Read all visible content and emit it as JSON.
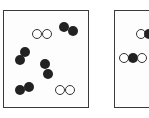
{
  "diagram": {
    "type": "particle-model",
    "panels": [
      {
        "id": "left",
        "box": {
          "x": 3,
          "y": 10,
          "w": 86,
          "h": 98
        },
        "molecules": [
          {
            "kind": "white-pair",
            "atoms": [
              {
                "x": 37,
                "y": 34,
                "r": 5,
                "fill": "light"
              },
              {
                "x": 47,
                "y": 34,
                "r": 5,
                "fill": "light"
              }
            ]
          },
          {
            "kind": "dark-pair",
            "atoms": [
              {
                "x": 64,
                "y": 27,
                "r": 5,
                "fill": "dark"
              },
              {
                "x": 73,
                "y": 31,
                "r": 5,
                "fill": "dark"
              }
            ]
          },
          {
            "kind": "dark-pair",
            "atoms": [
              {
                "x": 25,
                "y": 52,
                "r": 5,
                "fill": "dark"
              },
              {
                "x": 20,
                "y": 60,
                "r": 5,
                "fill": "dark"
              }
            ]
          },
          {
            "kind": "dark-pair",
            "atoms": [
              {
                "x": 45,
                "y": 64,
                "r": 5,
                "fill": "dark"
              },
              {
                "x": 48,
                "y": 74,
                "r": 5,
                "fill": "dark"
              }
            ]
          },
          {
            "kind": "dark-pair",
            "atoms": [
              {
                "x": 20,
                "y": 90,
                "r": 5,
                "fill": "dark"
              },
              {
                "x": 29,
                "y": 87,
                "r": 5,
                "fill": "dark"
              }
            ]
          },
          {
            "kind": "white-pair",
            "atoms": [
              {
                "x": 60,
                "y": 90,
                "r": 5,
                "fill": "light"
              },
              {
                "x": 70,
                "y": 90,
                "r": 5,
                "fill": "light"
              }
            ]
          }
        ]
      },
      {
        "id": "right",
        "box": {
          "x": 114,
          "y": 10,
          "w": 40,
          "h": 98
        },
        "molecules": [
          {
            "kind": "white-dark",
            "atoms": [
              {
                "x": 141,
                "y": 34,
                "r": 5,
                "fill": "light"
              },
              {
                "x": 149,
                "y": 34,
                "r": 5,
                "fill": "dark"
              }
            ]
          },
          {
            "kind": "white-dark-white",
            "atoms": [
              {
                "x": 124,
                "y": 58,
                "r": 5,
                "fill": "light"
              },
              {
                "x": 133,
                "y": 58,
                "r": 5,
                "fill": "dark"
              },
              {
                "x": 142,
                "y": 58,
                "r": 5,
                "fill": "light"
              }
            ]
          }
        ]
      }
    ]
  }
}
